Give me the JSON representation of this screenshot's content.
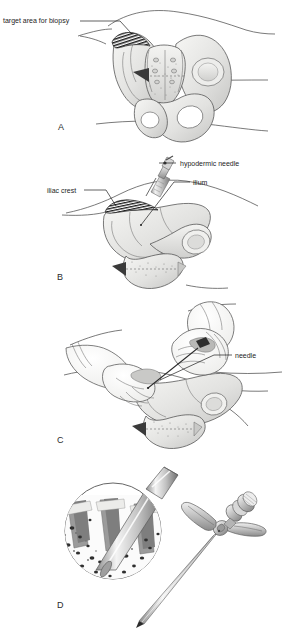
{
  "figure": {
    "panel_count": 4,
    "background_color": "#ffffff",
    "ink_color": "#1d1d1d"
  },
  "palette": {
    "bone_light": "#f2f2f0",
    "bone_mid": "#d9d9d7",
    "bone_shadow": "#b9b9b7",
    "bone_dark": "#8f8f8d",
    "hatch_dark": "#1a1a1a",
    "skin_fill": "#fbfbfb",
    "metal_light": "#e8e8e8",
    "metal_mid": "#bdbdbd",
    "metal_dark": "#7a7a7a",
    "marrow_white": "#fdfdfd",
    "cortex_gray": "#7e7e7e",
    "outline": "#585858"
  },
  "panels": [
    {
      "id": "panel-a",
      "letter": "A",
      "letter_x": 58,
      "letter_y": 130,
      "view": "posterior view of bony pelvis with patient lying prone",
      "labels": [
        {
          "id": "target-area-for-biopsy",
          "text": "target area for biopsy",
          "text_x": 3,
          "text_y": 23,
          "leader_from_x": 80,
          "leader_from_y": 21,
          "leader_to_x": 131,
          "leader_to_y": 33
        }
      ],
      "features": [
        "hatched target area on posterior superior iliac crest",
        "sacrum",
        "left and right ilium",
        "obturator foramina",
        "coccyx",
        "skin contour lines"
      ]
    },
    {
      "id": "panel-b",
      "letter": "B",
      "letter_x": 57,
      "letter_y": 280,
      "view": "lateral view of hemipelvis showing local anaesthetic infiltration",
      "labels": [
        {
          "id": "hypodermic-needle",
          "text": "hypodermic needle",
          "text_x": 180,
          "text_y": 163,
          "leader_from_x": 176,
          "leader_from_y": 161,
          "leader_to_x": 159,
          "leader_to_y": 166
        },
        {
          "id": "ilium",
          "text": "ilium",
          "text_x": 193,
          "text_y": 182,
          "leader_from_x": 190,
          "leader_from_y": 180,
          "leader_to_x": 141,
          "leader_to_y": 225
        },
        {
          "id": "iliac-crest",
          "text": "iliac crest",
          "text_x": 47,
          "text_y": 190,
          "leader_from_x": 80,
          "leader_from_y": 188,
          "leader_to_x": 116,
          "leader_to_y": 206
        }
      ],
      "features": [
        "syringe with hypodermic needle angled toward iliac crest",
        "hatched iliac crest target area",
        "ilium, ischium, pubis",
        "sacrum and coccyx",
        "skin surface contour"
      ]
    },
    {
      "id": "panel-c",
      "letter": "C",
      "letter_x": 57,
      "letter_y": 443,
      "view": "operator hands inserting the biopsy needle through the skin",
      "labels": [
        {
          "id": "needle",
          "text": "needle",
          "text_x": 235,
          "text_y": 355,
          "leader_from_x": 232,
          "leader_from_y": 353,
          "leader_to_x": 148,
          "leader_to_y": 388
        }
      ],
      "features": [
        "gloved right hand gripping trephine needle handle",
        "gloved left hand stabilising the skin",
        "hemipelvis beneath skin",
        "skin contour of the back and buttock"
      ]
    },
    {
      "id": "panel-d",
      "letter": "D",
      "letter_x": 57,
      "letter_y": 608,
      "view": "magnified inset of needle in trabecular bone and the trephine instrument",
      "labels": [],
      "features": [
        "circular magnified inset",
        "needle passing through cortical bone into marrow cavity",
        "trabecular bone with marrow spaces",
        "Jamshidi-type trephine biopsy needle with T-handle",
        "bevelled needle tip"
      ]
    }
  ]
}
